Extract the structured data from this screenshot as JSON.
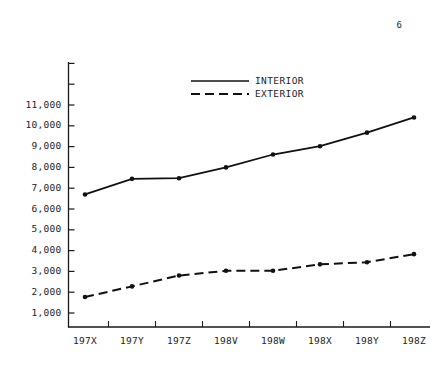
{
  "page": {
    "number": "6"
  },
  "chart_data": {
    "type": "line",
    "title": "",
    "subtitle": "",
    "xlabel": "",
    "ylabel": "",
    "categories": [
      "197X",
      "197Y",
      "197Z",
      "198V",
      "198W",
      "198X",
      "198Y",
      "198Z"
    ],
    "ytick_labels": [
      "1,000",
      "2,000",
      "3,000",
      "4,000",
      "5,000",
      "6,000",
      "7,000",
      "8,000",
      "9,000",
      "10,000",
      "11,000"
    ],
    "ytick_values": [
      1000,
      2000,
      3000,
      4000,
      5000,
      6000,
      7000,
      8000,
      9000,
      10000,
      11000
    ],
    "ylim": [
      0,
      11800
    ],
    "grid": false,
    "legend_position": "top-center",
    "series": [
      {
        "name": "INTERIOR",
        "style": "solid",
        "marker": "filled-circle",
        "color": "#111111",
        "values": [
          6700,
          7450,
          7480,
          8000,
          8620,
          9020,
          9670,
          10400
        ]
      },
      {
        "name": "EXTERIOR",
        "style": "dashed",
        "marker": "filled-circle",
        "color": "#111111",
        "values": [
          1770,
          2280,
          2800,
          3030,
          3030,
          3340,
          3440,
          3830
        ]
      }
    ]
  }
}
